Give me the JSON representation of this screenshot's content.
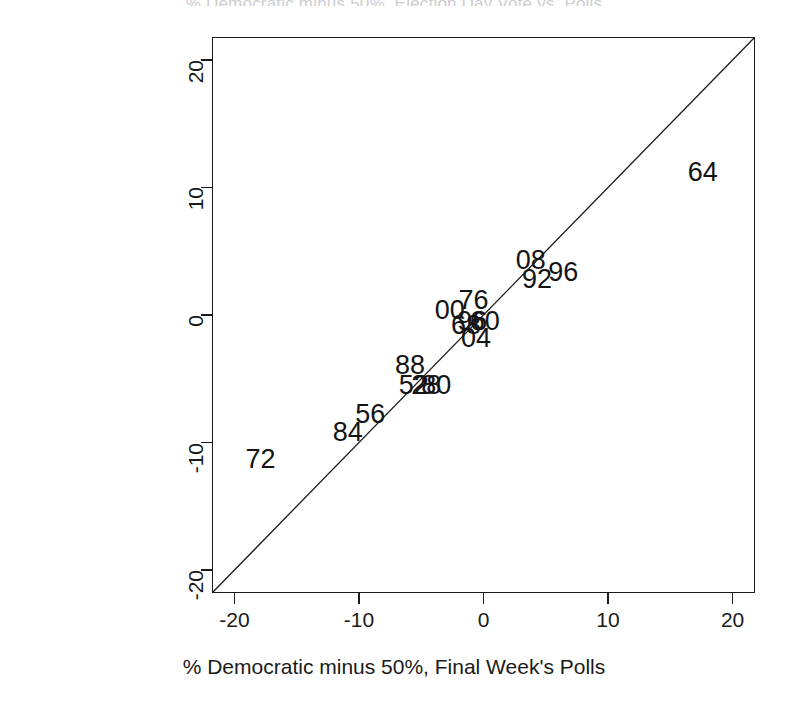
{
  "figure": {
    "title_partial": "% Democratic minus 50%, Election Day Vote vs. Polls",
    "background": "#ffffff",
    "ink_color": "#1a1a1a"
  },
  "chart_data": {
    "type": "scatter",
    "title": "",
    "xlabel": "% Democratic minus 50%, Final Week's Polls",
    "ylabel": "% Democratic minus 50%, Election Day Vote",
    "xlim": [
      -21.8,
      21.8
    ],
    "ylim": [
      -21.8,
      21.8
    ],
    "xticks": [
      -20,
      -10,
      0,
      10,
      20
    ],
    "yticks": [
      -20,
      -10,
      0,
      10,
      20
    ],
    "xticklabels": [
      "-20",
      "-10",
      "0",
      "10",
      "20"
    ],
    "yticklabels": [
      "-20",
      "-10",
      "0",
      "10",
      "20"
    ],
    "grid": false,
    "legend": null,
    "marker_style": "text-label",
    "reference_line": {
      "type": "identity",
      "label": "y = x",
      "from": [
        -21.8,
        -21.8
      ],
      "to": [
        21.8,
        21.8
      ]
    },
    "points": [
      {
        "label": "72",
        "x": -17.9,
        "y": -11.3
      },
      {
        "label": "84",
        "x": -10.9,
        "y": -9.2
      },
      {
        "label": "56",
        "x": -9.1,
        "y": -7.8
      },
      {
        "label": "88",
        "x": -5.9,
        "y": -3.9
      },
      {
        "label": "52",
        "x": -5.6,
        "y": -5.5
      },
      {
        "label": "28",
        "x": -4.6,
        "y": -5.5
      },
      {
        "label": "80",
        "x": -3.8,
        "y": -5.5
      },
      {
        "label": "00",
        "x": -2.7,
        "y": 0.4
      },
      {
        "label": "76",
        "x": -0.8,
        "y": 1.2
      },
      {
        "label": "68",
        "x": -1.4,
        "y": -0.8
      },
      {
        "label": "96",
        "x": -0.9,
        "y": -0.5
      },
      {
        "label": "60",
        "x": 0.1,
        "y": -0.5
      },
      {
        "label": "04",
        "x": -0.6,
        "y": -1.8
      },
      {
        "label": "08",
        "x": 3.8,
        "y": 4.3
      },
      {
        "label": "92",
        "x": 4.3,
        "y": 2.8
      },
      {
        "label": "96",
        "x": 6.4,
        "y": 3.4
      },
      {
        "label": "64",
        "x": 17.6,
        "y": 11.2
      }
    ]
  }
}
